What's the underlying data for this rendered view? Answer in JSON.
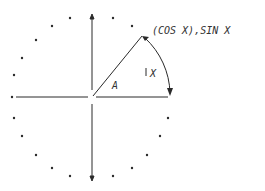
{
  "diagram": {
    "point_label": "(COS X),SIN X",
    "arc_label": "X",
    "angle_label": "A",
    "center": [
      92,
      97
    ],
    "radius": 78,
    "colors": {
      "ink": "#2a2a2a",
      "background": "#ffffff"
    }
  }
}
